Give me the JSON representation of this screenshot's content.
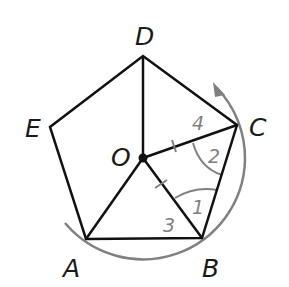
{
  "figure": {
    "colors": {
      "line": "#111111",
      "accent": "#808080",
      "background": "#ffffff"
    },
    "vertices": [
      {
        "id": "A",
        "label": "A",
        "x": 86,
        "y": 239
      },
      {
        "id": "B",
        "label": "B",
        "x": 202,
        "y": 238
      },
      {
        "id": "C",
        "label": "C",
        "x": 237,
        "y": 125
      },
      {
        "id": "D",
        "label": "D",
        "x": 143,
        "y": 56
      },
      {
        "id": "E",
        "label": "E",
        "x": 50,
        "y": 127
      }
    ],
    "center": {
      "id": "O",
      "label": "O",
      "x": 143,
      "y": 158
    },
    "angles": [
      {
        "label": "1",
        "at": "B",
        "between": [
          "O",
          "C"
        ]
      },
      {
        "label": "2",
        "at": "C",
        "between": [
          "O",
          "B"
        ]
      },
      {
        "label": "3",
        "at": "B",
        "between": [
          "A",
          "O"
        ]
      },
      {
        "label": "4",
        "at": "C",
        "between": [
          "D",
          "O"
        ]
      }
    ],
    "tick_marks": [
      {
        "segment": "OC",
        "count": 1
      },
      {
        "segment": "OB",
        "count": 1
      }
    ],
    "rotation_arc": {
      "direction": "counterclockwise",
      "from": "A",
      "to": "C",
      "arrow": true
    }
  }
}
